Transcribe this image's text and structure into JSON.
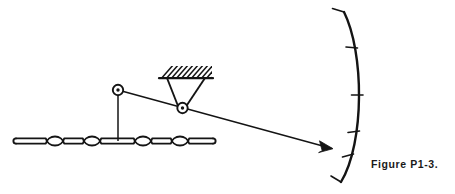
{
  "figure": {
    "caption": "Figure P1-3.",
    "title": "Figure P1-3.",
    "kind": "mechanical-linkage-schematic",
    "background_color": "#ffffff",
    "line_color": "#141414"
  },
  "parts": {
    "chain_bar": {
      "name": "horizontal chain link bar",
      "bulge_count": 4,
      "start_x": 16,
      "end_x": 213,
      "center_y": 141,
      "bar_half_thickness": 2.6,
      "bulge_radius": 9.5,
      "bulge_centers_x": [
        55,
        92,
        143,
        180
      ]
    },
    "vertical_rod": {
      "name": "vertical connecting rod",
      "x": 118,
      "top_y": 96,
      "bottom_y": 141
    },
    "left_pivot": {
      "name": "upper left pivot joint",
      "cx": 118,
      "cy": 90,
      "outer_radius": 5.2,
      "inner_radius": 1.7
    },
    "fulcrum_pivot": {
      "name": "fulcrum pivot joint",
      "cx": 182,
      "cy": 108,
      "outer_radius": 5.2,
      "inner_radius": 1.7
    },
    "ground_support": {
      "name": "hatched ground support",
      "left_x": 160,
      "right_x": 212,
      "baseline_y": 78,
      "hatch_height": 12,
      "hatch_line_count": 11
    },
    "bracket": {
      "name": "triangular bracket",
      "left_top_x": 166,
      "right_top_x": 206,
      "top_y": 78,
      "apex_left_x": 177,
      "apex_right_x": 188,
      "apex_y": 106
    },
    "lever_link": {
      "name": "diagonal lever link",
      "from_x": 118,
      "from_y": 90,
      "to_x": 330,
      "to_y": 148
    },
    "arrow": {
      "name": "arrow head pointing at scale",
      "tip_x": 332,
      "tip_y": 148.5,
      "length": 13,
      "half_width": 4
    },
    "arc_scale": {
      "name": "curved arc scale",
      "top_x": 344,
      "top_y": 12,
      "bottom_x": 341,
      "bottom_y": 182,
      "bulge_x": 363,
      "mid_y": 97,
      "tick_length": 11,
      "tick_count": 6,
      "tick_positions_y": [
        12,
        46,
        80,
        114,
        148,
        182
      ]
    }
  }
}
